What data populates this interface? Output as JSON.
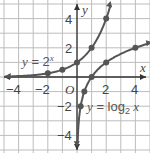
{
  "chart_data": {
    "type": "line",
    "title": "",
    "xlabel": "x",
    "ylabel": "y",
    "xlim": [
      -5,
      5
    ],
    "ylim": [
      -5,
      5
    ],
    "grid": true,
    "x_ticks": [
      -4,
      -2,
      2,
      4
    ],
    "y_ticks": [
      4,
      2,
      -2,
      -4
    ],
    "origin_label": "O",
    "series": [
      {
        "name": "y = 2^x",
        "label_prefix": "y = 2",
        "label_sup": "x",
        "points": [
          [
            -2,
            0.25
          ],
          [
            -1,
            0.5
          ],
          [
            0,
            1
          ],
          [
            1,
            2
          ],
          [
            2,
            4
          ]
        ]
      },
      {
        "name": "y = log2 x",
        "label_prefix": "y = log",
        "label_sub": "2",
        "label_suffix": " x",
        "points": [
          [
            0.25,
            -2
          ],
          [
            0.5,
            -1
          ],
          [
            1,
            0
          ],
          [
            2,
            1
          ],
          [
            4,
            2
          ]
        ]
      }
    ],
    "colors": {
      "curve": "#555555",
      "grid": "#bdbdbd",
      "axis": "#333333",
      "background": "#ffffff"
    }
  }
}
